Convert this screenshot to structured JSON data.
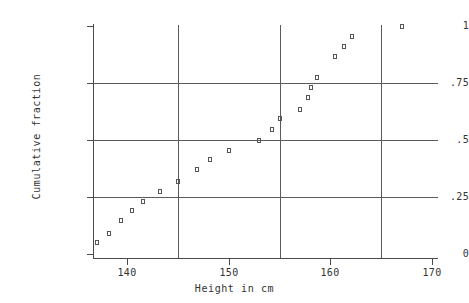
{
  "chart_data": {
    "type": "scatter",
    "title": "",
    "xlabel": "Height in cm",
    "ylabel": "Cumulative fraction",
    "xlim": [
      136.5,
      170.0
    ],
    "ylim": [
      0,
      1.02
    ],
    "xticks": [
      140,
      150,
      160,
      170
    ],
    "xtick_labels": [
      "140",
      "150",
      "160",
      "170"
    ],
    "yticks": [
      0,
      0.25,
      0.5,
      0.75,
      1
    ],
    "ytick_labels": [
      "0",
      ".25",
      ".5",
      ".75",
      "1"
    ],
    "grid": true,
    "grid_x_values": [
      145,
      155,
      165
    ],
    "grid_y_values": [
      0.25,
      0.5,
      0.75
    ],
    "marker": "open-square",
    "marker_color": "#555555",
    "axis_color": "#4a4a4a",
    "grid_color": "#5a5a5a",
    "background_color": "#ffffff",
    "legend": null,
    "x": [
      137.0,
      138.2,
      139.4,
      140.5,
      141.6,
      143.2,
      145.0,
      146.9,
      148.2,
      150.0,
      153.0,
      154.3,
      155.0,
      157.0,
      157.8,
      158.1,
      158.7,
      160.5,
      161.3,
      162.1,
      167.0
    ],
    "y": [
      0.05,
      0.09,
      0.145,
      0.19,
      0.23,
      0.275,
      0.32,
      0.37,
      0.415,
      0.455,
      0.5,
      0.545,
      0.595,
      0.635,
      0.685,
      0.73,
      0.775,
      0.865,
      0.91,
      0.955,
      1.0
    ],
    "points": [
      {
        "x": 137.0,
        "y": 0.05
      },
      {
        "x": 138.2,
        "y": 0.09
      },
      {
        "x": 139.4,
        "y": 0.145
      },
      {
        "x": 140.5,
        "y": 0.19
      },
      {
        "x": 141.6,
        "y": 0.23
      },
      {
        "x": 143.2,
        "y": 0.275
      },
      {
        "x": 145.0,
        "y": 0.32
      },
      {
        "x": 146.9,
        "y": 0.37
      },
      {
        "x": 148.2,
        "y": 0.415
      },
      {
        "x": 150.0,
        "y": 0.455
      },
      {
        "x": 153.0,
        "y": 0.5
      },
      {
        "x": 154.3,
        "y": 0.545
      },
      {
        "x": 155.0,
        "y": 0.595
      },
      {
        "x": 157.0,
        "y": 0.635
      },
      {
        "x": 157.8,
        "y": 0.685
      },
      {
        "x": 158.1,
        "y": 0.73
      },
      {
        "x": 158.7,
        "y": 0.775
      },
      {
        "x": 160.5,
        "y": 0.865
      },
      {
        "x": 161.3,
        "y": 0.91
      },
      {
        "x": 162.1,
        "y": 0.955
      },
      {
        "x": 167.0,
        "y": 1.0
      }
    ]
  }
}
